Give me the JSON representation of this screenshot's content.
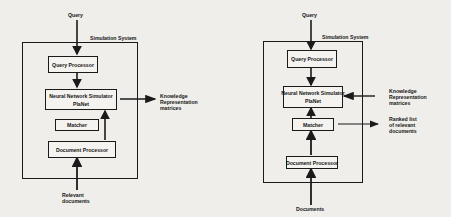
{
  "diagrams": [
    {
      "system_label": "Simulation System",
      "input_top": "Query",
      "components": {
        "query_processor": "Query Processor",
        "nn_line1": "Neural Network Simulator",
        "nn_line2": "PlaNet",
        "matcher": "Matcher",
        "document_processor": "Document Processor"
      },
      "output_right": [
        "Knowledge",
        "Representation",
        "matrices"
      ],
      "input_bottom": [
        "Relevant",
        "documents"
      ]
    },
    {
      "system_label": "Simulation System",
      "input_top": "Query",
      "components": {
        "query_processor": "Query Processor",
        "nn_line1": "Neural Network Simulator",
        "nn_line2": "PlaNet",
        "matcher": "Matcher",
        "document_processor": "Document Processor"
      },
      "input_right": [
        "Knowledge",
        "Representation",
        "matrices"
      ],
      "output_right": [
        "Ranked list",
        "of relevant",
        "documents"
      ],
      "input_bottom": [
        "Documents"
      ]
    }
  ]
}
